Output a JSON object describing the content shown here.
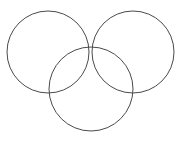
{
  "figure": {
    "name": "three-overlapping-circles",
    "type": "venn-trefoil-diagram",
    "width": 181,
    "height": 141,
    "background_color": "#ffffff",
    "stroke_color": "#4a4a4a",
    "stroke_width": 1,
    "fill": "none",
    "labels": [],
    "circles": [
      {
        "id": "top-left-circle",
        "name": "Top left circle",
        "cx": 48,
        "cy": 52,
        "r": 41
      },
      {
        "id": "top-right-circle",
        "name": "Top right circle",
        "cx": 133,
        "cy": 52,
        "r": 41
      },
      {
        "id": "bottom-center-circle",
        "name": "Bottom center circle",
        "cx": 91,
        "cy": 89,
        "r": 42
      }
    ]
  },
  "chart_data": {
    "type": "scatter",
    "title": "",
    "xlabel": "",
    "ylabel": "",
    "xlim": [
      0,
      181
    ],
    "ylim": [
      0,
      141
    ],
    "grid": false,
    "legend": "none",
    "annotations": [],
    "series": [
      {
        "name": "circle-centers",
        "x": [
          48,
          133,
          91
        ],
        "y": [
          52,
          52,
          89
        ],
        "radii": [
          41,
          41,
          42
        ]
      }
    ]
  }
}
